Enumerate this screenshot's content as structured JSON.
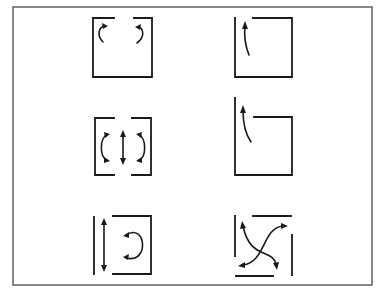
{
  "figure": {
    "frame": {
      "x": 13,
      "y": 7,
      "width": 359,
      "height": 278,
      "color": "#555555"
    },
    "ink_color": "#1a1a1a",
    "panels": [
      {
        "id": "a",
        "row": 1,
        "col": 1,
        "description": "square enclosure with gap at top center; two curled arrows turning outward near top"
      },
      {
        "id": "b",
        "row": 1,
        "col": 2,
        "description": "square enclosure with gap at top left; one curved arrow rising through gap"
      },
      {
        "id": "c",
        "row": 2,
        "col": 1,
        "description": "bracketed enclosure with gaps at top and bottom center; two C-shaped circulating arrows and a central double-headed vertical arrow"
      },
      {
        "id": "d",
        "row": 2,
        "col": 2,
        "description": "enclosure with extended left wall and lowered top edge; one curved arrow rising past top edge"
      },
      {
        "id": "e",
        "row": 3,
        "col": 1,
        "description": "separate vertical wall on left with double-headed vertical arrow; bracket on right with C-shaped circulating arrow"
      },
      {
        "id": "f",
        "row": 3,
        "col": 2,
        "description": "four separated wall segments with two crossing S-shaped double-headed arrows"
      }
    ]
  }
}
